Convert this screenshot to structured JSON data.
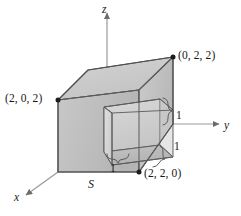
{
  "figure": {
    "type": "3d-solid-diagram",
    "surface_label": "S",
    "axes": [
      {
        "name": "z-axis",
        "label": "z",
        "direction": "up"
      },
      {
        "name": "y-axis",
        "label": "y",
        "direction": "right"
      },
      {
        "name": "x-axis",
        "label": "x",
        "direction": "down-left"
      }
    ],
    "vertex_labels": [
      {
        "name": "vertex-0-2-2",
        "text": "(0, 2, 2)"
      },
      {
        "name": "vertex-2-0-2",
        "text": "(2, 0, 2)"
      },
      {
        "name": "vertex-2-2-0",
        "text": "(2, 2, 0)"
      }
    ],
    "dimension_labels": [
      {
        "name": "notch-height",
        "text": "1"
      },
      {
        "name": "notch-depth",
        "text": "1"
      },
      {
        "name": "notch-width",
        "text": "1"
      }
    ],
    "colors": {
      "outline": "#4f4f4f",
      "face_top": "#c9c9c9",
      "face_left": "#bdbdbd",
      "face_front": "#d6d6d6",
      "face_right": "#c2c2c2",
      "notch_inner_back": "#cfcfcf",
      "notch_inner_floor": "#bcbcbc",
      "notch_inner_side": "#d9d9d9",
      "axis": "#9a9a9a",
      "text": "#171717",
      "background": "#ffffff"
    }
  }
}
